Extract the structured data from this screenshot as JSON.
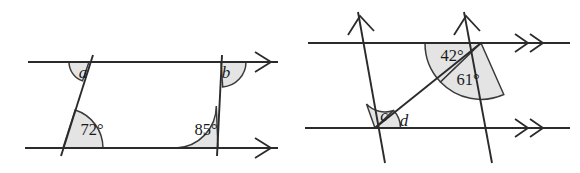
{
  "diagram": {
    "background_color": "#ffffff",
    "line_color": "#2b2b2b",
    "sector_fill_color": "#e4e4e4",
    "sector_stroke_color": "#3a3a3a",
    "figures": [
      {
        "id": "left-figure",
        "name": "Two transversals crossing two parallel lines",
        "parallel_mark": "single-chevron",
        "parallel_mark_count": 1,
        "angles": [
          {
            "id": "angle-a",
            "label": "a",
            "type": "variable",
            "vertex": "top-left",
            "x": 83,
            "y": 74
          },
          {
            "id": "angle-72",
            "label": "72°",
            "type": "numeric",
            "value": 72,
            "unit": "degrees",
            "vertex": "bottom-left",
            "x": 92,
            "y": 131
          },
          {
            "id": "angle-b",
            "label": "b",
            "type": "variable",
            "vertex": "top-right",
            "x": 224,
            "y": 74
          },
          {
            "id": "angle-85",
            "label": "85°",
            "type": "numeric",
            "value": 85,
            "unit": "degrees",
            "vertex": "bottom-right",
            "x": 208,
            "y": 131
          }
        ]
      },
      {
        "id": "right-figure",
        "name": "Two parallel slanted lines and a diagonal crossing two parallel lines",
        "parallel_mark": "double-chevron",
        "parallel_mark_count": 2,
        "slant_mark": "single-chevron-up",
        "angles": [
          {
            "id": "angle-42",
            "label": "42°",
            "type": "numeric",
            "value": 42,
            "unit": "degrees",
            "vertex": "top-right-intersection",
            "x": 452,
            "y": 57
          },
          {
            "id": "angle-61",
            "label": "61°",
            "type": "numeric",
            "value": 61,
            "unit": "degrees",
            "vertex": "top-right-intersection",
            "x": 465,
            "y": 80
          },
          {
            "id": "angle-c",
            "label": "c",
            "type": "variable",
            "vertex": "bottom-left-intersection",
            "x": 385,
            "y": 117
          },
          {
            "id": "angle-d",
            "label": "d",
            "type": "variable",
            "vertex": "bottom-left-intersection",
            "x": 404,
            "y": 123
          }
        ]
      }
    ]
  }
}
